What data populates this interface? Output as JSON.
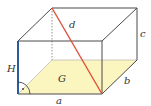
{
  "diagram": {
    "type": "cuboid",
    "labels": {
      "a": "a",
      "b": "b",
      "c": "c",
      "d": "d",
      "G": "G",
      "H": "H"
    },
    "colors": {
      "edges": "#4a4a4a",
      "diagonal": "#e0503a",
      "height": "#2c5aa0",
      "base_fill": "#fbf5c0",
      "background": "#ffffff"
    }
  }
}
